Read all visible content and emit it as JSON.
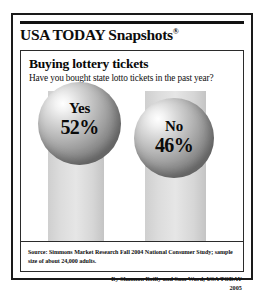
{
  "masthead": {
    "brand": "USA TODAY Snapshots",
    "registered_mark": "®"
  },
  "headline": "Buying lottery tickets",
  "subhead": "Have you bought state lotto tickets in the past year?",
  "responses": [
    {
      "answer": "Yes",
      "percent": "52%"
    },
    {
      "answer": "No",
      "percent": "46%"
    }
  ],
  "source": "Source: Simmons Market Research Fall 2004 National Consumer Study; sample size of about 24,000 adults.",
  "byline": {
    "credit": "By Shannon Reilly and Sam Ward, USA TODAY",
    "year": "2005"
  },
  "colors": {
    "frame": "#1a1a1a",
    "rule": "#111111",
    "text": "#0a0a0a",
    "pedestal": "#dcdcdc",
    "sphere_highlight": "#ffffff",
    "sphere_shadow": "#7e7e7e",
    "background": "#ffffff"
  },
  "chart_data": {
    "type": "bar",
    "title": "Buying lottery tickets",
    "subtitle": "Have you bought state lotto tickets in the past year?",
    "categories": [
      "Yes",
      "No"
    ],
    "values": [
      52,
      46
    ],
    "xlabel": "",
    "ylabel": "Percent of adults",
    "ylim": [
      0,
      100
    ],
    "grid": false,
    "legend": "none",
    "annotations": [
      "Source: Simmons Market Research Fall 2004 National Consumer Study; sample size of about 24,000 adults."
    ]
  }
}
